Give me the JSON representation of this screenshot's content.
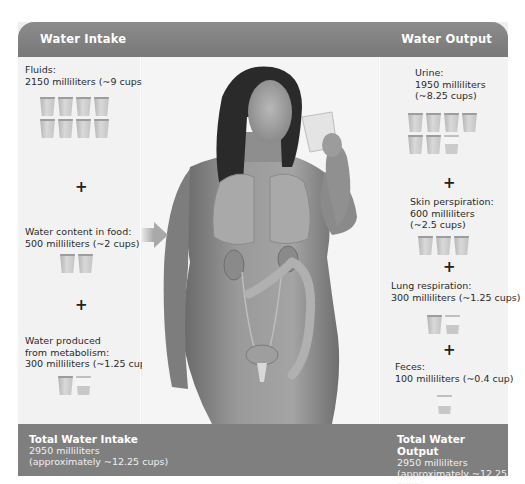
{
  "header": {
    "intake_title": "Water Intake",
    "output_title": "Water Output"
  },
  "intake": {
    "items": [
      {
        "label_line1": "Fluids:",
        "label_line2": "2150 milliliters (~9 cups)",
        "full_cups": 8,
        "partial_cups": 0
      },
      {
        "label_line1": "Water content in food:",
        "label_line2": "500 milliliters (~2 cups)",
        "full_cups": 2,
        "partial_cups": 0
      },
      {
        "label_line1": "Water produced",
        "label_line2": "from metabolism:",
        "label_line3": "300 milliliters (~1.25 cups)",
        "full_cups": 1,
        "partial_cups": 1
      }
    ],
    "plus_symbol": "+"
  },
  "output": {
    "items": [
      {
        "label_line1": "Urine:",
        "label_line2": "1950 milliliters",
        "label_line3": "(~8.25 cups)",
        "full_cups": 6,
        "partial_cups": 1
      },
      {
        "label_line1": "Skin perspiration:",
        "label_line2": "600 milliliters",
        "label_line3": "(~2.5 cups)",
        "full_cups": 3,
        "partial_cups": 0
      },
      {
        "label_line1": "Lung respiration:",
        "label_line2": "300 milliliters (~1.25 cups)",
        "full_cups": 1,
        "partial_cups": 1
      },
      {
        "label_line1": "Feces:",
        "label_line2": "100 milliliters (~0.4 cup)",
        "full_cups": 0,
        "partial_cups": 1
      }
    ],
    "plus_symbol": "+"
  },
  "footer": {
    "intake_title": "Total Water Intake",
    "intake_ml": "2950 milliliters",
    "intake_cups": "(approximately ~12.25 cups)",
    "output_title": "Total Water Output",
    "output_ml": "2950 milliliters",
    "output_cups": "(approximately ~12.25 cups)"
  },
  "illustration": {
    "subject": "woman drinking glass of water with lungs, kidneys, bladder and colon shown",
    "icon": "human-anatomy-figure"
  },
  "colors": {
    "header_bar": "#808080",
    "footer_bar": "#7f7f7f",
    "panel_bg": "#f2f2f2",
    "text": "#2a2a2a",
    "header_text": "#ffffff"
  }
}
